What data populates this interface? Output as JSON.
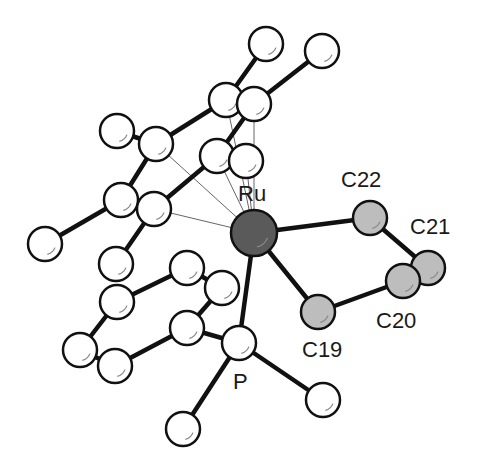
{
  "diagram": {
    "type": "molecular-structure",
    "colors": {
      "background": "#ffffff",
      "ru": "#5a5a5a",
      "carbon_highlight": "#bdbdbd",
      "atom": "#ffffff",
      "bond": "#111111",
      "weak_bond": "#666666"
    },
    "labels": {
      "ru": "Ru",
      "c22": "C22",
      "c21": "C21",
      "c20": "C20",
      "c19": "C19",
      "p": "P"
    },
    "atoms": [
      {
        "id": "Ru",
        "x": 254,
        "y": 233,
        "r": 23,
        "kind": "ru"
      },
      {
        "id": "C22",
        "x": 370,
        "y": 218,
        "r": 17,
        "kind": "hl"
      },
      {
        "id": "C21",
        "x": 428,
        "y": 268,
        "r": 17,
        "kind": "hl"
      },
      {
        "id": "C20",
        "x": 403,
        "y": 281,
        "r": 17,
        "kind": "hl"
      },
      {
        "id": "C19",
        "x": 318,
        "y": 312,
        "r": 17,
        "kind": "hl"
      },
      {
        "id": "P",
        "x": 239,
        "y": 343,
        "r": 17,
        "kind": "plain"
      },
      {
        "id": "Me1",
        "x": 266,
        "y": 44,
        "r": 17,
        "kind": "plain"
      },
      {
        "id": "Me2",
        "x": 322,
        "y": 51,
        "r": 17,
        "kind": "plain"
      },
      {
        "id": "Cp1",
        "x": 226,
        "y": 100,
        "r": 17,
        "kind": "plain"
      },
      {
        "id": "Cp2",
        "x": 254,
        "y": 104,
        "r": 17,
        "kind": "plain"
      },
      {
        "id": "Cp3",
        "x": 156,
        "y": 144,
        "r": 17,
        "kind": "plain"
      },
      {
        "id": "Me3",
        "x": 117,
        "y": 131,
        "r": 17,
        "kind": "plain"
      },
      {
        "id": "Cp4",
        "x": 217,
        "y": 156,
        "r": 17,
        "kind": "plain"
      },
      {
        "id": "Cp5",
        "x": 246,
        "y": 161,
        "r": 17,
        "kind": "plain"
      },
      {
        "id": "Cp6",
        "x": 121,
        "y": 200,
        "r": 17,
        "kind": "plain"
      },
      {
        "id": "Cp7",
        "x": 154,
        "y": 209,
        "r": 17,
        "kind": "plain"
      },
      {
        "id": "Me4",
        "x": 45,
        "y": 244,
        "r": 17,
        "kind": "plain"
      },
      {
        "id": "Me5",
        "x": 116,
        "y": 264,
        "r": 17,
        "kind": "plain"
      },
      {
        "id": "Ph1",
        "x": 187,
        "y": 268,
        "r": 17,
        "kind": "plain"
      },
      {
        "id": "Ph2",
        "x": 222,
        "y": 288,
        "r": 17,
        "kind": "plain"
      },
      {
        "id": "Ph3",
        "x": 117,
        "y": 302,
        "r": 17,
        "kind": "plain"
      },
      {
        "id": "Ph4",
        "x": 187,
        "y": 328,
        "r": 17,
        "kind": "plain"
      },
      {
        "id": "Ph5",
        "x": 80,
        "y": 350,
        "r": 17,
        "kind": "plain"
      },
      {
        "id": "Ph6",
        "x": 115,
        "y": 366,
        "r": 17,
        "kind": "plain"
      },
      {
        "id": "PMe1",
        "x": 183,
        "y": 429,
        "r": 17,
        "kind": "plain"
      },
      {
        "id": "PMe2",
        "x": 323,
        "y": 400,
        "r": 17,
        "kind": "plain"
      }
    ],
    "bonds": [
      [
        "Ru",
        "C22"
      ],
      [
        "C22",
        "C21"
      ],
      [
        "C21",
        "C20"
      ],
      [
        "C20",
        "C19"
      ],
      [
        "C19",
        "Ru"
      ],
      [
        "Ru",
        "P"
      ],
      [
        "Me1",
        "Cp1"
      ],
      [
        "Me2",
        "Cp2"
      ],
      [
        "Cp1",
        "Cp3"
      ],
      [
        "Cp2",
        "Cp4"
      ],
      [
        "Cp1",
        "Cp2"
      ],
      [
        "Me3",
        "Cp3"
      ],
      [
        "Cp3",
        "Cp6"
      ],
      [
        "Cp4",
        "Cp7"
      ],
      [
        "Cp4",
        "Cp5"
      ],
      [
        "Cp6",
        "Cp7"
      ],
      [
        "Cp6",
        "Me4"
      ],
      [
        "Cp7",
        "Me5"
      ],
      [
        "Ph1",
        "Ph3"
      ],
      [
        "Ph1",
        "Ph2"
      ],
      [
        "Ph2",
        "Ph4"
      ],
      [
        "Ph3",
        "Ph5"
      ],
      [
        "Ph5",
        "Ph6"
      ],
      [
        "Ph6",
        "Ph4"
      ],
      [
        "Ph4",
        "P"
      ],
      [
        "P",
        "PMe1"
      ],
      [
        "P",
        "PMe2"
      ]
    ],
    "weak_bonds": [
      [
        "Ru",
        "Cp1"
      ],
      [
        "Ru",
        "Cp2"
      ],
      [
        "Ru",
        "Cp3"
      ],
      [
        "Ru",
        "Cp4"
      ],
      [
        "Ru",
        "Cp5"
      ],
      [
        "Ru",
        "Cp7"
      ]
    ]
  }
}
